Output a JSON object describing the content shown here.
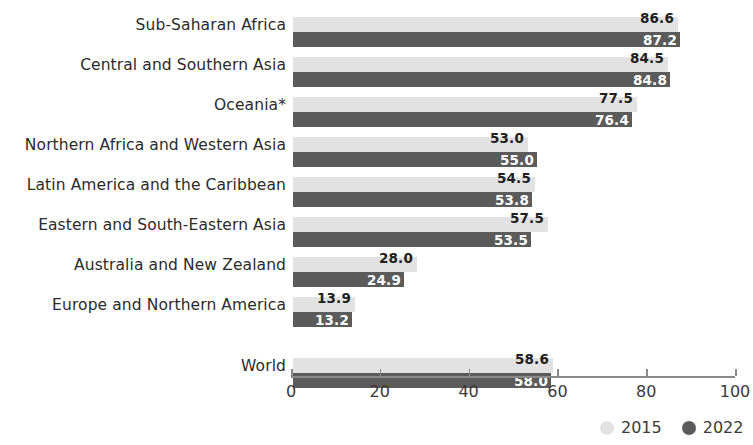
{
  "chart_data": {
    "type": "bar",
    "orientation": "horizontal",
    "title": "",
    "subtitle": "",
    "xlabel": "",
    "ylabel": "",
    "xlim": [
      0,
      100
    ],
    "xticks": [
      0,
      20,
      40,
      60,
      80,
      100
    ],
    "xtick_labels": [
      "0",
      "20",
      "40",
      "60",
      "80",
      "100"
    ],
    "grid": false,
    "legend_position": "bottom-right",
    "categories": [
      "Sub-Saharan Africa",
      "Central and Southern Asia",
      "Oceania*",
      "Northern Africa and Western Asia",
      "Latin America and the Caribbean",
      "Eastern and South-Eastern Asia",
      "Australia and New Zealand",
      "Europe and Northern America",
      "World"
    ],
    "series": [
      {
        "name": "2015",
        "color": "#e2e2e2",
        "values": [
          86.6,
          84.5,
          77.5,
          53.0,
          54.5,
          57.5,
          28.0,
          13.9,
          58.6
        ],
        "labels": [
          "86.6",
          "84.5",
          "77.5",
          "53.0",
          "54.5",
          "57.5",
          "28.0",
          "13.9",
          "58.6"
        ]
      },
      {
        "name": "2022",
        "color": "#5b5b5b",
        "values": [
          87.2,
          84.8,
          76.4,
          55.0,
          53.8,
          53.5,
          24.9,
          13.2,
          58.0
        ],
        "labels": [
          "87.2",
          "84.8",
          "76.4",
          "55.0",
          "53.8",
          "53.5",
          "24.9",
          "13.2",
          "58.0"
        ]
      }
    ]
  },
  "legend": {
    "items": [
      {
        "label": "2015",
        "color": "#e2e2e2"
      },
      {
        "label": "2022",
        "color": "#5b5b5b"
      }
    ]
  }
}
